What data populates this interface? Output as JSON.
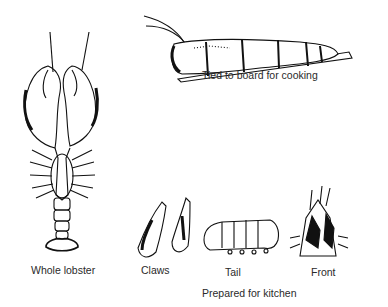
{
  "figures": {
    "whole": {
      "label": "Whole lobster"
    },
    "tied": {
      "label": "Tied to board for cooking"
    },
    "claws": {
      "label": "Claws"
    },
    "tail": {
      "label": "Tail"
    },
    "front": {
      "label": "Front"
    }
  },
  "group_caption": "Prepared for kitchen"
}
